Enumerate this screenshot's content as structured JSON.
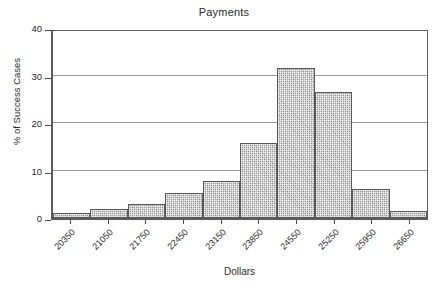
{
  "chart_data": {
    "type": "bar",
    "title": "Payments",
    "xlabel": "Dollars",
    "ylabel": "% of Success Cases",
    "categories": [
      "20350",
      "21050",
      "21750",
      "22450",
      "23150",
      "23850",
      "24550",
      "25250",
      "25950",
      "26650"
    ],
    "values": [
      1.1,
      1.8,
      2.9,
      5.3,
      7.8,
      15.8,
      31.5,
      26.5,
      6.1,
      1.5
    ],
    "ylim": [
      0,
      40
    ],
    "yticks": [
      0,
      10,
      20,
      30,
      40
    ],
    "ytick_labels": [
      "0",
      "10",
      "20",
      "30",
      "40"
    ],
    "grid": "horizontal",
    "legend": "none",
    "bar_color": "#aaaaaa",
    "bar_edge_color": "#5a5a5a",
    "gridline_color": "#9a9a9a",
    "axis_color": "#5c5c5c",
    "background": "#ffffff"
  }
}
